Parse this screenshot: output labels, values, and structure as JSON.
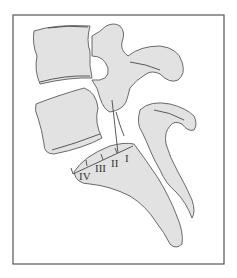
{
  "figure": {
    "type": "anatomical-line-drawing",
    "labels": [
      "I",
      "II",
      "III",
      "IV"
    ],
    "colors": {
      "bone_fill": "#e2e2e2",
      "outline": "#5a5a5a",
      "frame": "#555555",
      "background": "#ffffff"
    }
  }
}
